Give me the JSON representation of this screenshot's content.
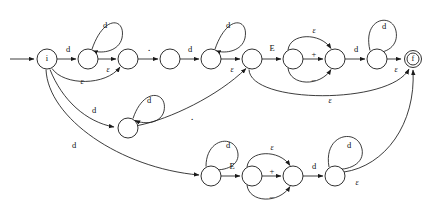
{
  "diagram": {
    "title": "",
    "type": "finite-state-automaton",
    "colors": {
      "stroke": "#1a1a1a",
      "background": "#ffffff",
      "label": "#111111"
    },
    "symbols": {
      "digit": "d",
      "epsilon": "ε",
      "dot": ".",
      "exponent": "E",
      "plus": "+",
      "minus": "−",
      "initial": "i",
      "final": "f"
    },
    "nodes": [
      {
        "id": "n0",
        "label": "i",
        "cx": 47,
        "cy": 59,
        "r": 10,
        "accepting": false,
        "start": true
      },
      {
        "id": "n1",
        "label": "",
        "cx": 88,
        "cy": 59,
        "r": 10,
        "accepting": false,
        "start": false
      },
      {
        "id": "n2",
        "label": "",
        "cx": 128,
        "cy": 59,
        "r": 10,
        "accepting": false,
        "start": false
      },
      {
        "id": "n3",
        "label": "",
        "cx": 170,
        "cy": 59,
        "r": 10,
        "accepting": false,
        "start": false
      },
      {
        "id": "n4",
        "label": "",
        "cx": 211,
        "cy": 59,
        "r": 10,
        "accepting": false,
        "start": false
      },
      {
        "id": "n5",
        "label": "",
        "cx": 252,
        "cy": 59,
        "r": 10,
        "accepting": false,
        "start": false
      },
      {
        "id": "n6",
        "label": "",
        "cx": 293,
        "cy": 59,
        "r": 10,
        "accepting": false,
        "start": false
      },
      {
        "id": "n7",
        "label": "",
        "cx": 335,
        "cy": 59,
        "r": 10,
        "accepting": false,
        "start": false
      },
      {
        "id": "n8",
        "label": "",
        "cx": 377,
        "cy": 59,
        "r": 10,
        "accepting": false,
        "start": false
      },
      {
        "id": "nf",
        "label": "f",
        "cx": 413,
        "cy": 59,
        "r": 8.5,
        "accepting": true,
        "start": false
      },
      {
        "id": "m1",
        "label": "",
        "cx": 128,
        "cy": 128,
        "r": 10,
        "accepting": false,
        "start": false
      },
      {
        "id": "b1",
        "label": "",
        "cx": 211,
        "cy": 176,
        "r": 10,
        "accepting": false,
        "start": false
      },
      {
        "id": "b2",
        "label": "",
        "cx": 252,
        "cy": 176,
        "r": 10,
        "accepting": false,
        "start": false
      },
      {
        "id": "b3",
        "label": "",
        "cx": 293,
        "cy": 176,
        "r": 10,
        "accepting": false,
        "start": false
      },
      {
        "id": "b4",
        "label": "",
        "cx": 335,
        "cy": 176,
        "r": 10,
        "accepting": false,
        "start": false
      }
    ],
    "edge_labels": [
      {
        "id": "l-start-d",
        "text": "d",
        "x": 68,
        "y": 50,
        "style": "plain"
      },
      {
        "id": "l-n1-self-d",
        "text": "d",
        "x": 105,
        "y": 26,
        "style": "plain"
      },
      {
        "id": "l-n1-n2-eps",
        "text": "ε",
        "x": 108,
        "y": 70,
        "style": "eps"
      },
      {
        "id": "l-n0-n2-eps",
        "text": "ε",
        "x": 82,
        "y": 82,
        "style": "eps"
      },
      {
        "id": "l-n2-n3-dot",
        "text": ".",
        "x": 149,
        "y": 50,
        "style": "dot"
      },
      {
        "id": "l-n3-n4-d",
        "text": "d",
        "x": 190,
        "y": 50,
        "style": "plain"
      },
      {
        "id": "l-n4-self-d",
        "text": "d",
        "x": 228,
        "y": 26,
        "style": "plain"
      },
      {
        "id": "l-n4-n5-eps",
        "text": "ε",
        "x": 232,
        "y": 70,
        "style": "eps"
      },
      {
        "id": "l-n5-n6-E",
        "text": "E",
        "x": 272,
        "y": 49,
        "style": "plain"
      },
      {
        "id": "l-n6-n7-plus",
        "text": "+",
        "x": 314,
        "y": 56,
        "style": "plain"
      },
      {
        "id": "l-n6-n7-eps",
        "text": "ε",
        "x": 314,
        "y": 31,
        "style": "eps"
      },
      {
        "id": "l-n6-n7-minus",
        "text": "−",
        "x": 314,
        "y": 81,
        "style": "plain"
      },
      {
        "id": "l-n7-n8-d",
        "text": "d",
        "x": 356,
        "y": 50,
        "style": "plain"
      },
      {
        "id": "l-n8-self-d",
        "text": "d",
        "x": 382,
        "y": 27,
        "style": "plain"
      },
      {
        "id": "l-n8-nf-eps",
        "text": "ε",
        "x": 396,
        "y": 70,
        "style": "eps"
      },
      {
        "id": "l-n5-nf-eps",
        "text": "ε",
        "x": 330,
        "y": 100,
        "style": "eps"
      },
      {
        "id": "l-n0-m1-d",
        "text": "d",
        "x": 94,
        "y": 111,
        "style": "plain"
      },
      {
        "id": "l-m1-self-d",
        "text": "d",
        "x": 148,
        "y": 101,
        "style": "plain"
      },
      {
        "id": "l-m1-n5-dot",
        "text": ".",
        "x": 192,
        "y": 118,
        "style": "dot"
      },
      {
        "id": "l-n0-b1-d",
        "text": "d",
        "x": 74,
        "y": 146,
        "style": "plain"
      },
      {
        "id": "l-b1-self-d",
        "text": "d",
        "x": 228,
        "y": 148,
        "style": "plain"
      },
      {
        "id": "l-b1-b2-E",
        "text": "E",
        "x": 232,
        "y": 167,
        "style": "plain"
      },
      {
        "id": "l-b2-b3-plus",
        "text": "+",
        "x": 272,
        "y": 172,
        "style": "plain"
      },
      {
        "id": "l-b2-b3-eps",
        "text": "ε",
        "x": 272,
        "y": 149,
        "style": "eps"
      },
      {
        "id": "l-b2-b3-minus",
        "text": "−",
        "x": 272,
        "y": 197,
        "style": "plain"
      },
      {
        "id": "l-b3-b4-d",
        "text": "d",
        "x": 314,
        "y": 167,
        "style": "plain"
      },
      {
        "id": "l-b4-self-d",
        "text": "d",
        "x": 349,
        "y": 146,
        "style": "plain"
      },
      {
        "id": "l-b4-nf-eps",
        "text": "ε",
        "x": 356,
        "y": 182,
        "style": "eps"
      }
    ],
    "transitions": [
      {
        "from": "start",
        "to": "n0",
        "symbol": ""
      },
      {
        "from": "n0",
        "to": "n1",
        "symbol": "d"
      },
      {
        "from": "n1",
        "to": "n1",
        "symbol": "d"
      },
      {
        "from": "n1",
        "to": "n2",
        "symbol": "ε"
      },
      {
        "from": "n0",
        "to": "n2",
        "symbol": "ε"
      },
      {
        "from": "n2",
        "to": "n3",
        "symbol": "."
      },
      {
        "from": "n3",
        "to": "n4",
        "symbol": "d"
      },
      {
        "from": "n4",
        "to": "n4",
        "symbol": "d"
      },
      {
        "from": "n4",
        "to": "n5",
        "symbol": "ε"
      },
      {
        "from": "n5",
        "to": "n6",
        "symbol": "E"
      },
      {
        "from": "n6",
        "to": "n7",
        "symbol": "+"
      },
      {
        "from": "n6",
        "to": "n7",
        "symbol": "ε"
      },
      {
        "from": "n6",
        "to": "n7",
        "symbol": "−"
      },
      {
        "from": "n7",
        "to": "n8",
        "symbol": "d"
      },
      {
        "from": "n8",
        "to": "n8",
        "symbol": "d"
      },
      {
        "from": "n8",
        "to": "nf",
        "symbol": "ε"
      },
      {
        "from": "n5",
        "to": "nf",
        "symbol": "ε"
      },
      {
        "from": "n0",
        "to": "m1",
        "symbol": "d"
      },
      {
        "from": "m1",
        "to": "m1",
        "symbol": "d"
      },
      {
        "from": "m1",
        "to": "n5",
        "symbol": "."
      },
      {
        "from": "n0",
        "to": "b1",
        "symbol": "d"
      },
      {
        "from": "b1",
        "to": "b1",
        "symbol": "d"
      },
      {
        "from": "b1",
        "to": "b2",
        "symbol": "E"
      },
      {
        "from": "b2",
        "to": "b3",
        "symbol": "+"
      },
      {
        "from": "b2",
        "to": "b3",
        "symbol": "ε"
      },
      {
        "from": "b2",
        "to": "b3",
        "symbol": "−"
      },
      {
        "from": "b3",
        "to": "b4",
        "symbol": "d"
      },
      {
        "from": "b4",
        "to": "b4",
        "symbol": "d"
      },
      {
        "from": "b4",
        "to": "nf",
        "symbol": "ε"
      }
    ]
  }
}
